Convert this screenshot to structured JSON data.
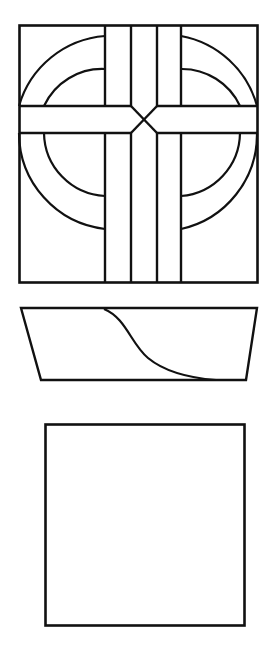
{
  "document": {
    "title": "Line-Art Figure Sheet",
    "background_color": "#ffffff",
    "stroke_color": "#111111",
    "width": 277,
    "height": 653,
    "figure_count": 3
  },
  "figures": [
    {
      "id": "figure-1",
      "name": "cross-and-circle-window",
      "description": "Rectangular stained-glass window panel with a central cross of four vertical mullions, a horizontal band, concentric quarter arcs in each corner quadrant and an X crossing at the center",
      "bounds": {
        "x": 19,
        "y": 25,
        "width": 239,
        "height": 258
      },
      "parts": [
        {
          "name": "panel-outline",
          "shape": "rectangle"
        },
        {
          "name": "horizontal-band-top-edge",
          "shape": "line",
          "y": 106
        },
        {
          "name": "horizontal-band-bottom-edge",
          "shape": "line",
          "y": 133
        },
        {
          "name": "mullion-1",
          "shape": "line",
          "x": 105
        },
        {
          "name": "mullion-2",
          "shape": "line",
          "x": 131
        },
        {
          "name": "mullion-3",
          "shape": "line",
          "x": 157
        },
        {
          "name": "mullion-4",
          "shape": "line",
          "x": 181
        },
        {
          "name": "arc-outer-top-left",
          "shape": "quarter-arc"
        },
        {
          "name": "arc-inner-top-left",
          "shape": "quarter-arc"
        },
        {
          "name": "arc-outer-top-right",
          "shape": "quarter-arc"
        },
        {
          "name": "arc-inner-top-right",
          "shape": "quarter-arc"
        },
        {
          "name": "arc-outer-bottom-left",
          "shape": "quarter-arc"
        },
        {
          "name": "arc-inner-bottom-left",
          "shape": "quarter-arc"
        },
        {
          "name": "arc-outer-bottom-right",
          "shape": "quarter-arc"
        },
        {
          "name": "arc-inner-bottom-right",
          "shape": "quarter-arc"
        },
        {
          "name": "center-x-crossing",
          "shape": "x-cross"
        }
      ]
    },
    {
      "id": "figure-2",
      "name": "trapezoid-with-s-curve",
      "description": "Downward-tapering trapezoid containing an S-shaped curve running from the top edge to the bottom edge",
      "bounds": {
        "x": 21,
        "y": 308,
        "width": 236,
        "height": 72
      },
      "corners": {
        "top_left": [
          21,
          308
        ],
        "top_right": [
          257,
          308
        ],
        "bottom_right": [
          246,
          380
        ],
        "bottom_left": [
          41,
          380
        ]
      },
      "parts": [
        {
          "name": "trapezoid-outline",
          "shape": "polygon"
        },
        {
          "name": "s-curve",
          "shape": "cubic-bezier"
        }
      ]
    },
    {
      "id": "figure-3",
      "name": "empty-square",
      "description": "Plain empty square outline",
      "bounds": {
        "x": 45,
        "y": 424,
        "width": 200,
        "height": 202
      },
      "parts": [
        {
          "name": "square-outline",
          "shape": "rectangle"
        }
      ]
    }
  ]
}
